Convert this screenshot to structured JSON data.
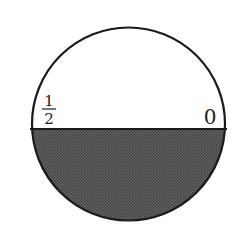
{
  "diagram": {
    "shape": "circle",
    "center": [
      128.5,
      124
    ],
    "radius": 96.5,
    "divider_y": 129,
    "shaded_region": "lower",
    "colors": {
      "stroke": "#1a1a1a",
      "shade": "#555555",
      "background": "#ffffff"
    },
    "labels": {
      "left_numerator": "1",
      "left_denominator": "2",
      "right": "0"
    }
  }
}
